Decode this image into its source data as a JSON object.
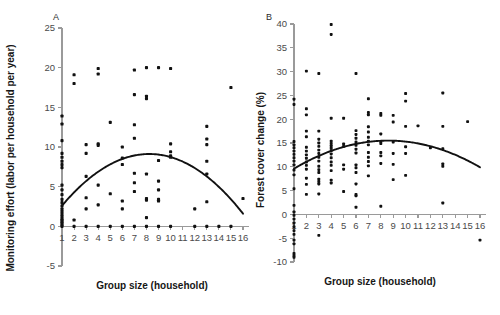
{
  "figure": {
    "panel_a_letter": "A",
    "panel_b_letter": "B"
  },
  "chart_data": [
    {
      "type": "scatter",
      "panel": "A",
      "title": "",
      "xlabel": "Group size (household)",
      "ylabel": "Monitoring effort (labor per household per year)",
      "xlim": [
        1,
        16
      ],
      "ylim": [
        -5,
        25
      ],
      "xticks": [
        1,
        2,
        3,
        4,
        5,
        6,
        7,
        8,
        9,
        10,
        11,
        12,
        13,
        14,
        15,
        16
      ],
      "xtick_labels": [
        "1",
        "2",
        "3",
        "4",
        "5",
        "6",
        "7",
        "8",
        "9",
        "10",
        "11",
        "12",
        "13",
        "14",
        "15",
        "16"
      ],
      "yticks": [
        -5,
        0,
        5,
        10,
        15,
        20,
        25
      ],
      "ytick_labels": [
        "-5",
        "0",
        "5",
        "10",
        "15",
        "20",
        "25"
      ],
      "grid": false,
      "legend": "none",
      "points": [
        [
          1,
          0.0
        ],
        [
          1,
          0.2
        ],
        [
          1,
          0.4
        ],
        [
          1,
          0.6
        ],
        [
          1,
          0.8
        ],
        [
          1,
          1.0
        ],
        [
          1,
          1.3
        ],
        [
          1,
          1.6
        ],
        [
          1,
          1.9
        ],
        [
          1,
          2.2
        ],
        [
          1,
          2.6
        ],
        [
          1,
          3.0
        ],
        [
          1,
          3.4
        ],
        [
          1,
          4.0
        ],
        [
          1,
          4.6
        ],
        [
          1,
          5.2
        ],
        [
          1,
          7.4
        ],
        [
          1,
          7.8
        ],
        [
          1,
          8.2
        ],
        [
          1,
          8.7
        ],
        [
          1,
          9.2
        ],
        [
          1,
          10.8
        ],
        [
          1,
          12.9
        ],
        [
          1,
          13.9
        ],
        [
          2,
          0.0
        ],
        [
          2,
          0.8
        ],
        [
          2,
          18.0
        ],
        [
          2,
          19.1
        ],
        [
          3,
          0.0
        ],
        [
          3,
          2.2
        ],
        [
          3,
          3.6
        ],
        [
          3,
          6.3
        ],
        [
          3,
          9.2
        ],
        [
          3,
          10.3
        ],
        [
          4,
          0.0
        ],
        [
          4,
          2.7
        ],
        [
          4,
          5.2
        ],
        [
          4,
          10.2
        ],
        [
          4,
          10.4
        ],
        [
          4,
          19.2
        ],
        [
          4,
          19.9
        ],
        [
          5,
          0.0
        ],
        [
          5,
          4.1
        ],
        [
          5,
          13.1
        ],
        [
          6,
          0.0
        ],
        [
          6,
          2.2
        ],
        [
          6,
          3.2
        ],
        [
          6,
          7.8
        ],
        [
          6,
          8.6
        ],
        [
          6,
          10.0
        ],
        [
          7,
          0.0
        ],
        [
          7,
          4.4
        ],
        [
          7,
          5.5
        ],
        [
          7,
          6.7
        ],
        [
          7,
          11.1
        ],
        [
          7,
          12.8
        ],
        [
          7,
          16.6
        ],
        [
          7,
          19.7
        ],
        [
          8,
          0.0
        ],
        [
          8,
          1.1
        ],
        [
          8,
          3.3
        ],
        [
          8,
          3.5
        ],
        [
          8,
          6.6
        ],
        [
          8,
          16.1
        ],
        [
          8,
          16.4
        ],
        [
          8,
          20.0
        ],
        [
          9,
          0.0
        ],
        [
          9,
          3.2
        ],
        [
          9,
          3.4
        ],
        [
          9,
          4.6
        ],
        [
          9,
          5.7
        ],
        [
          9,
          8.3
        ],
        [
          9,
          20.0
        ],
        [
          10,
          0.0
        ],
        [
          10,
          8.7
        ],
        [
          10,
          8.9
        ],
        [
          10,
          9.4
        ],
        [
          10,
          10.4
        ],
        [
          10,
          19.9
        ],
        [
          12,
          0.0
        ],
        [
          12,
          2.2
        ],
        [
          13,
          0.0
        ],
        [
          13,
          3.1
        ],
        [
          13,
          6.6
        ],
        [
          13,
          8.2
        ],
        [
          13,
          10.3
        ],
        [
          13,
          11.0
        ],
        [
          13,
          12.6
        ],
        [
          14,
          0.0
        ],
        [
          15,
          0.0
        ],
        [
          15,
          17.5
        ],
        [
          16,
          3.5
        ]
      ],
      "fit_curve": {
        "kind": "quadratic",
        "note": "inverted-U fitted curve",
        "x_start": 1,
        "x_end": 16,
        "y_at_x_start": 2.6,
        "y_peak": 9.1,
        "x_peak": 8.6,
        "y_at_x_end": 1.6
      }
    },
    {
      "type": "scatter",
      "panel": "B",
      "title": "",
      "xlabel": "Group size (household)",
      "ylabel": "Forest cover change (%)",
      "xlim": [
        1,
        16
      ],
      "ylim": [
        -10,
        40
      ],
      "xticks": [
        1,
        2,
        3,
        4,
        5,
        6,
        7,
        8,
        9,
        10,
        11,
        12,
        13,
        14,
        15,
        16
      ],
      "xtick_labels": [
        "1",
        "2",
        "3",
        "4",
        "5",
        "6",
        "7",
        "8",
        "9",
        "10",
        "11",
        "12",
        "13",
        "14",
        "15",
        "16"
      ],
      "yticks": [
        -10,
        -5,
        0,
        5,
        10,
        15,
        20,
        25,
        30,
        35,
        40
      ],
      "ytick_labels": [
        "-10",
        "-5",
        "0",
        "5",
        "10",
        "15",
        "20",
        "25",
        "30",
        "35",
        "40"
      ],
      "grid": false,
      "legend": "none",
      "points": [
        [
          1,
          -9.0
        ],
        [
          1,
          -8.6
        ],
        [
          1,
          -8.2
        ],
        [
          1,
          -6.2
        ],
        [
          1,
          -5.4
        ],
        [
          1,
          -4.2
        ],
        [
          1,
          -3.4
        ],
        [
          1,
          -2.6
        ],
        [
          1,
          -1.8
        ],
        [
          1,
          -1.0
        ],
        [
          1,
          -0.2
        ],
        [
          1,
          0.5
        ],
        [
          1,
          1.9
        ],
        [
          1,
          5.4
        ],
        [
          1,
          8.3
        ],
        [
          1,
          9.3
        ],
        [
          1,
          10.4
        ],
        [
          1,
          11.2
        ],
        [
          1,
          11.9
        ],
        [
          1,
          12.6
        ],
        [
          1,
          13.3
        ],
        [
          1,
          14.0
        ],
        [
          1,
          14.6
        ],
        [
          1,
          15.3
        ],
        [
          1,
          23.1
        ],
        [
          1,
          24.2
        ],
        [
          2,
          4.2
        ],
        [
          2,
          6.3
        ],
        [
          2,
          7.6
        ],
        [
          2,
          9.5
        ],
        [
          2,
          10.3
        ],
        [
          2,
          11.0
        ],
        [
          2,
          11.8
        ],
        [
          2,
          12.5
        ],
        [
          2,
          13.3
        ],
        [
          2,
          14.1
        ],
        [
          2,
          16.3
        ],
        [
          2,
          17.5
        ],
        [
          2,
          20.9
        ],
        [
          2,
          22.2
        ],
        [
          2,
          30.1
        ],
        [
          3,
          -4.4
        ],
        [
          3,
          4.3
        ],
        [
          3,
          6.4
        ],
        [
          3,
          6.9
        ],
        [
          3,
          7.4
        ],
        [
          3,
          8.8
        ],
        [
          3,
          9.4
        ],
        [
          3,
          10.1
        ],
        [
          3,
          11.2
        ],
        [
          3,
          12.0
        ],
        [
          3,
          12.8
        ],
        [
          3,
          13.5
        ],
        [
          3,
          14.3
        ],
        [
          3,
          15.0
        ],
        [
          3,
          15.8
        ],
        [
          3,
          17.5
        ],
        [
          3,
          29.6
        ],
        [
          4,
          6.6
        ],
        [
          4,
          7.2
        ],
        [
          4,
          9.2
        ],
        [
          4,
          10.3
        ],
        [
          4,
          11.0
        ],
        [
          4,
          11.9
        ],
        [
          4,
          12.7
        ],
        [
          4,
          13.4
        ],
        [
          4,
          13.9
        ],
        [
          4,
          14.4
        ],
        [
          4,
          14.9
        ],
        [
          4,
          15.4
        ],
        [
          4,
          20.2
        ],
        [
          4,
          37.8
        ],
        [
          4,
          39.9
        ],
        [
          5,
          4.8
        ],
        [
          5,
          9.5
        ],
        [
          5,
          10.4
        ],
        [
          5,
          14.3
        ],
        [
          5,
          14.8
        ],
        [
          5,
          20.2
        ],
        [
          6,
          1.5
        ],
        [
          6,
          3.9
        ],
        [
          6,
          4.2
        ],
        [
          6,
          6.4
        ],
        [
          6,
          8.8
        ],
        [
          6,
          9.8
        ],
        [
          6,
          10.4
        ],
        [
          6,
          12.9
        ],
        [
          6,
          13.7
        ],
        [
          6,
          14.5
        ],
        [
          6,
          15.2
        ],
        [
          6,
          16.0
        ],
        [
          6,
          16.8
        ],
        [
          6,
          17.6
        ],
        [
          6,
          29.6
        ],
        [
          7,
          8.1
        ],
        [
          7,
          10.2
        ],
        [
          7,
          11.1
        ],
        [
          7,
          12.0
        ],
        [
          7,
          13.0
        ],
        [
          7,
          14.6
        ],
        [
          7,
          15.4
        ],
        [
          7,
          16.2
        ],
        [
          7,
          17.3
        ],
        [
          7,
          18.4
        ],
        [
          7,
          20.9
        ],
        [
          7,
          21.4
        ],
        [
          7,
          24.3
        ],
        [
          8,
          1.7
        ],
        [
          8,
          10.7
        ],
        [
          8,
          12.3
        ],
        [
          8,
          13.0
        ],
        [
          8,
          14.9
        ],
        [
          8,
          15.3
        ],
        [
          8,
          16.9
        ],
        [
          8,
          20.8
        ],
        [
          8,
          21.2
        ],
        [
          9,
          7.3
        ],
        [
          9,
          10.5
        ],
        [
          9,
          12.8
        ],
        [
          9,
          15.2
        ],
        [
          9,
          19.4
        ],
        [
          9,
          20.8
        ],
        [
          10,
          8.2
        ],
        [
          10,
          12.8
        ],
        [
          10,
          14.2
        ],
        [
          10,
          18.5
        ],
        [
          10,
          23.8
        ],
        [
          10,
          25.4
        ],
        [
          11,
          18.6
        ],
        [
          12,
          14.0
        ],
        [
          13,
          2.4
        ],
        [
          13,
          10.1
        ],
        [
          13,
          10.6
        ],
        [
          13,
          13.8
        ],
        [
          13,
          18.5
        ],
        [
          13,
          25.5
        ],
        [
          15,
          19.5
        ],
        [
          16,
          -5.4
        ]
      ],
      "fit_curve": {
        "kind": "quadratic",
        "note": "shallow inverted-U fitted curve",
        "x_start": 1,
        "x_end": 16,
        "y_at_x_start": 9.6,
        "y_peak": 15.5,
        "x_peak": 8.5,
        "y_at_x_end": 9.9
      }
    }
  ]
}
